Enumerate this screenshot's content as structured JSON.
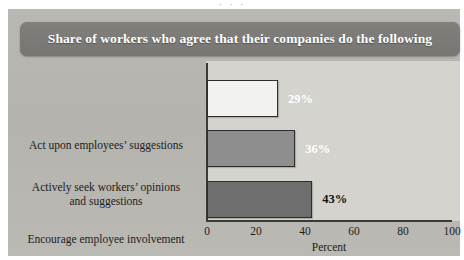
{
  "figure": {
    "title": "Share of workers who agree that their companies do the following",
    "clipped_caption_fragment": "· · ·"
  },
  "colors": {
    "banner": "#7b7a77",
    "panel": "#b6b5af",
    "plot_background": "#d4d3ce",
    "axis": "#3b3a38",
    "bar_1": "#f2f2f0",
    "bar_2": "#8e8e8e",
    "bar_3": "#6e6e6e",
    "value_label_light": "#ffffff",
    "value_label_dark": "#111111"
  },
  "chart_data": {
    "type": "bar",
    "orientation": "horizontal",
    "title": "Share of workers who agree that their companies do the following",
    "categories": [
      "Act upon employees’ suggestions",
      "Actively seek workers’ opinions and suggestions",
      "Encourage employee involvement"
    ],
    "category_lines": [
      [
        "Act upon employees’ suggestions"
      ],
      [
        "Actively seek workers’ opinions",
        "and suggestions"
      ],
      [
        "Encourage employee involvement"
      ]
    ],
    "values": [
      29,
      36,
      43
    ],
    "value_labels": [
      "29%",
      "36%",
      "43%"
    ],
    "bar_colors": [
      "#f2f2f0",
      "#8e8e8e",
      "#6e6e6e"
    ],
    "label_colors": [
      "#ffffff",
      "#ffffff",
      "#111111"
    ],
    "xlabel": "Percent",
    "ylabel": "",
    "xlim": [
      0,
      100
    ],
    "xticks": [
      0,
      20,
      40,
      60,
      80,
      100
    ],
    "xticklabels": [
      "0",
      "20",
      "40",
      "60",
      "80",
      "100"
    ],
    "grid": false,
    "legend": false
  }
}
